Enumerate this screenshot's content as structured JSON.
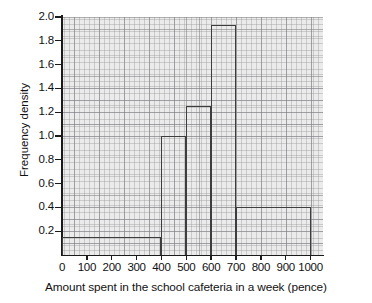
{
  "chart_data": {
    "type": "bar",
    "title": "",
    "xlabel": "Amount spent in the school cafeteria in a week (pence)",
    "ylabel": "Frequency density",
    "xlim": [
      0,
      1050
    ],
    "ylim": [
      0,
      2.0
    ],
    "grid": "graph-paper",
    "legend": "none",
    "x_ticks": [
      "0",
      "100",
      "200",
      "300",
      "400",
      "500",
      "600",
      "700",
      "800",
      "900",
      "1000"
    ],
    "x_tick_values": [
      0,
      100,
      200,
      300,
      400,
      500,
      600,
      700,
      800,
      900,
      1000
    ],
    "y_ticks": [
      "0.2",
      "0.4",
      "0.6",
      "0.8",
      "1.0",
      "1.2",
      "1.4",
      "1.6",
      "1.8",
      "2.0"
    ],
    "y_tick_values": [
      0.2,
      0.4,
      0.6,
      0.8,
      1.0,
      1.2,
      1.4,
      1.6,
      1.8,
      2.0
    ],
    "bins": [
      {
        "label": "0-400",
        "start": 0,
        "end": 400,
        "value": 0.15
      },
      {
        "label": "400-500",
        "start": 400,
        "end": 500,
        "value": 1.0
      },
      {
        "label": "500-600",
        "start": 500,
        "end": 600,
        "value": 1.25
      },
      {
        "label": "600-700",
        "start": 600,
        "end": 700,
        "value": 1.93
      },
      {
        "label": "700-1000",
        "start": 700,
        "end": 1000,
        "value": 0.4
      }
    ],
    "categories": [
      "0-400",
      "400-500",
      "500-600",
      "600-700",
      "700-1000"
    ],
    "values": [
      0.15,
      1.0,
      1.25,
      1.93,
      0.4
    ],
    "colors": {
      "bar_outline": "#3d3d3d",
      "bar_fill": "transparent",
      "axis": "#1a1a1a",
      "grid_paper": "#e9e9e9",
      "text": "#111111"
    }
  }
}
